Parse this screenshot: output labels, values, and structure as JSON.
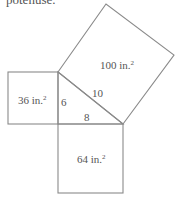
{
  "caption": "potenuse.",
  "colors": {
    "stroke": "#888888",
    "text": "#555555",
    "background": "#ffffff"
  },
  "triangle": {
    "side_a": "6",
    "side_b": "8",
    "hypotenuse": "10"
  },
  "squares": {
    "left": {
      "area": "36",
      "unit": "in.",
      "exp": "2"
    },
    "bottom": {
      "area": "64",
      "unit": "in.",
      "exp": "2"
    },
    "hypotenuse": {
      "area": "100",
      "unit": "in.",
      "exp": "2"
    }
  }
}
